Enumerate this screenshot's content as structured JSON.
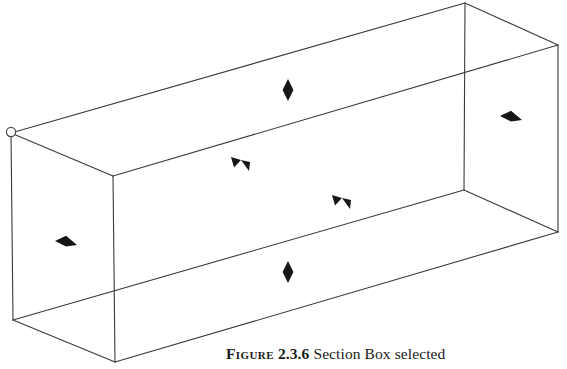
{
  "document": {
    "type": "book-figure-page",
    "background_color": "#ffffff"
  },
  "figure": {
    "name": "section-box-3d-view",
    "line_color": "#3a3a3a",
    "grip_color": "#111111",
    "geometry": {
      "projection": "isometric",
      "vertices": {
        "back_top_left": [
          11,
          133
        ],
        "top_apex": [
          465,
          3
        ],
        "top_right": [
          558,
          45
        ],
        "near_top": [
          113,
          176
        ],
        "near_right_top": [
          463,
          190
        ],
        "bottom_right": [
          558,
          232
        ],
        "left_bottom": [
          13,
          320
        ],
        "near_bottom": [
          115,
          362
        ]
      }
    },
    "grips": [
      {
        "name": "corner-grip-back-top-left",
        "type": "circle",
        "x": 11,
        "y": 132
      },
      {
        "name": "top-face-arrow-grip",
        "type": "arrow-vertical",
        "x": 288,
        "y": 90
      },
      {
        "name": "right-face-arrow-grip",
        "type": "arrow-horizontal",
        "x": 511,
        "y": 118
      },
      {
        "name": "top-left-face-arrow-grip",
        "type": "arrow-diagonal-down",
        "x": 240,
        "y": 162
      },
      {
        "name": "top-right-face-arrow-grip",
        "type": "arrow-diagonal-down",
        "x": 341,
        "y": 200
      },
      {
        "name": "front-face-arrow-grip",
        "type": "arrow-horizontal",
        "x": 66,
        "y": 243
      },
      {
        "name": "bottom-face-arrow-grip",
        "type": "arrow-vertical",
        "x": 288,
        "y": 272
      }
    ]
  },
  "caption": {
    "label": "Figure",
    "number": "2.3.6",
    "text": "Section Box selected",
    "full": "FIGURE 2.3.6 Section Box selected"
  }
}
